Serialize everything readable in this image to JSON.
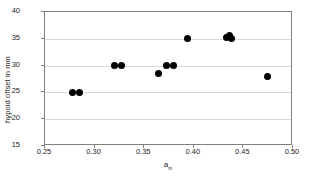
{
  "chart_data": {
    "type": "scatter",
    "title": "",
    "xlabel": "a_m",
    "xlabel_base": "a",
    "xlabel_sub": "m",
    "ylabel": "hypoid offset in mm",
    "xlim": [
      0.25,
      0.5
    ],
    "ylim": [
      15,
      40
    ],
    "xticks": [
      0.25,
      0.3,
      0.35,
      0.4,
      0.45,
      0.5
    ],
    "xtick_labels": [
      "0.25",
      "0.30",
      "0.35",
      "0.40",
      "0.45",
      "0.50"
    ],
    "yticks": [
      15,
      20,
      25,
      30,
      35,
      40
    ],
    "ytick_labels": [
      "15",
      "20",
      "25",
      "30",
      "35",
      "40"
    ],
    "grid": "horizontal",
    "legend": "none",
    "marker": "filled-circle",
    "marker_color": "#000000",
    "series": [
      {
        "name": "hypoid offset",
        "points": [
          {
            "x": 0.278,
            "y": 25.0
          },
          {
            "x": 0.285,
            "y": 25.0
          },
          {
            "x": 0.32,
            "y": 30.0
          },
          {
            "x": 0.327,
            "y": 30.0
          },
          {
            "x": 0.364,
            "y": 28.6
          },
          {
            "x": 0.372,
            "y": 30.0
          },
          {
            "x": 0.38,
            "y": 30.0
          },
          {
            "x": 0.394,
            "y": 35.0
          },
          {
            "x": 0.433,
            "y": 35.2
          },
          {
            "x": 0.436,
            "y": 35.6
          },
          {
            "x": 0.438,
            "y": 35.0
          },
          {
            "x": 0.474,
            "y": 27.9
          }
        ]
      }
    ]
  },
  "colors": {
    "axis": "#808080",
    "grid": "#d9d9d9",
    "text": "#262626",
    "marker": "#000000",
    "background": "#ffffff"
  }
}
